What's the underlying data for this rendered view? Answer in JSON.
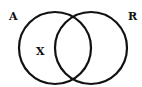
{
  "diagram": {
    "type": "venn",
    "sets": [
      {
        "label": "A",
        "cx": 55,
        "cy": 48,
        "r": 36
      },
      {
        "label": "R",
        "cx": 91,
        "cy": 48,
        "r": 36
      }
    ],
    "region_labels": [
      {
        "label": "X",
        "region": "A only"
      }
    ],
    "colors": {
      "stroke": "#111111",
      "background": "#ffffff"
    }
  }
}
